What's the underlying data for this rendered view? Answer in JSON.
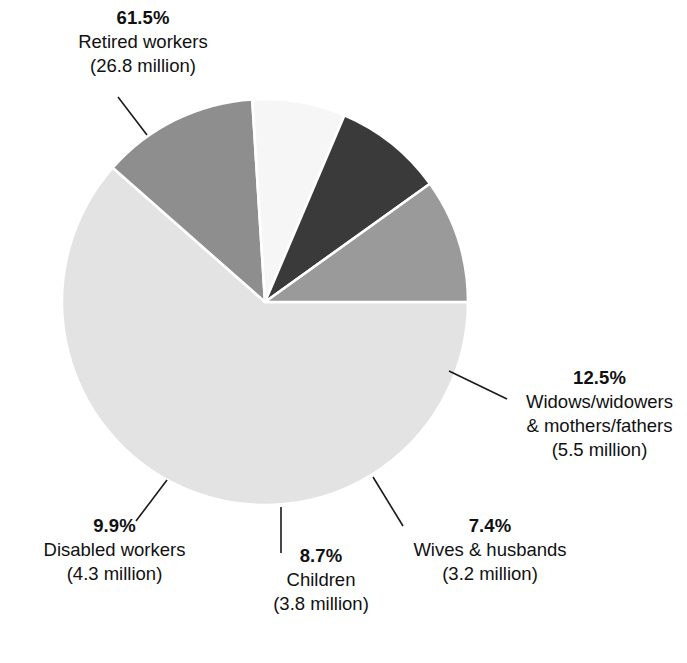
{
  "chart_data": {
    "type": "pie",
    "title": "",
    "subtitle": "",
    "xlabel": "",
    "ylabel": "",
    "legend_position": "none",
    "grid": false,
    "units": "percent of beneficiaries",
    "start_angle_deg": 0,
    "direction": "clockwise",
    "categories": [
      "Retired workers",
      "Widows/widowers & mothers/fathers",
      "Wives & husbands",
      "Children",
      "Disabled workers"
    ],
    "values": [
      61.5,
      12.5,
      7.4,
      8.7,
      9.9
    ],
    "counts_millions": [
      26.8,
      5.5,
      3.2,
      3.8,
      4.3
    ],
    "colors": [
      "#e3e3e3",
      "#8e8e8e",
      "#f6f6f6",
      "#3a3a3a",
      "#9a9a9a"
    ],
    "slices": [
      {
        "name": "retired-workers",
        "percent_text": "61.5%",
        "label_text": "Retired workers",
        "count_text": "(26.8 million)",
        "value": 61.5,
        "count_millions": 26.8,
        "color": "#e3e3e3"
      },
      {
        "name": "widows-widowers-mothers-fathers",
        "percent_text": "12.5%",
        "label_text": "Widows/widowers",
        "label_text_2": "& mothers/fathers",
        "count_text": "(5.5 million)",
        "value": 12.5,
        "count_millions": 5.5,
        "color": "#8e8e8e"
      },
      {
        "name": "wives-husbands",
        "percent_text": "7.4%",
        "label_text": "Wives & husbands",
        "count_text": "(3.2 million)",
        "value": 7.4,
        "count_millions": 3.2,
        "color": "#f6f6f6"
      },
      {
        "name": "children",
        "percent_text": "8.7%",
        "label_text": "Children",
        "count_text": "(3.8 million)",
        "value": 8.7,
        "count_millions": 3.8,
        "color": "#3a3a3a"
      },
      {
        "name": "disabled-workers",
        "percent_text": "9.9%",
        "label_text": "Disabled workers",
        "count_text": "(4.3 million)",
        "value": 9.9,
        "count_millions": 4.3,
        "color": "#9a9a9a"
      }
    ]
  },
  "geometry": {
    "center_x": 265,
    "center_y": 302,
    "radius": 203,
    "separator_color": "#ffffff",
    "separator_width": 2.6,
    "leader_color": "#1a1a1a",
    "leader_width": 1.6
  },
  "labels": {
    "retired": {
      "percent": "61.5%",
      "line1": "Retired workers",
      "line2": "(26.8 million)"
    },
    "widows": {
      "percent": "12.5%",
      "line1": "Widows/widowers",
      "line2": "& mothers/fathers",
      "line3": "(5.5 million)"
    },
    "wives": {
      "percent": "7.4%",
      "line1": "Wives & husbands",
      "line2": "(3.2 million)"
    },
    "children": {
      "percent": "8.7%",
      "line1": "Children",
      "line2": "(3.8 million)"
    },
    "disabled": {
      "percent": "9.9%",
      "line1": "Disabled workers",
      "line2": "(4.3 million)"
    }
  }
}
